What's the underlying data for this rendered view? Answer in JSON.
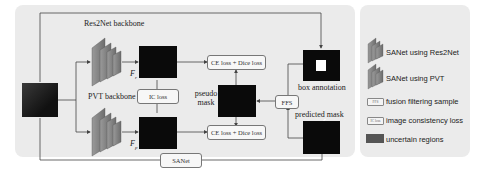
{
  "diagram": {
    "labels": {
      "res2net_backbone": "Res2Net backbone",
      "pvt_backbone": "PVT backbone",
      "f_r": "F",
      "f_r_sub": "r",
      "f_p": "F",
      "f_p_sub": "p",
      "pseudo_mask": "pseudo mask",
      "box_annotation": "box annotation",
      "predicted_mask": "predicted mask"
    },
    "boxes": {
      "ce_dice_top": "CE loss + Dice loss",
      "ce_dice_bottom": "CE loss + Dice loss",
      "ic_loss": "IC loss",
      "ffs": "FFS",
      "sanet": "SANet"
    }
  },
  "legend": {
    "items": [
      {
        "icon": "res2net-stack-icon",
        "label": "SANet using Res2Net"
      },
      {
        "icon": "pvt-stack-icon",
        "label": "SANet using PVT"
      },
      {
        "icon": "ffs-box-icon",
        "chip": "FFS",
        "label": "fusion filtering sample"
      },
      {
        "icon": "ic-loss-box-icon",
        "chip": "IC loss",
        "label": "image consistency loss"
      },
      {
        "icon": "uncertain-region-swatch",
        "label": "uncertain regions"
      }
    ],
    "colors": {
      "uncertain_regions": "#555555",
      "res2net_stack": "#8a8a8a",
      "pvt_stack": "#8a8a8a"
    }
  }
}
